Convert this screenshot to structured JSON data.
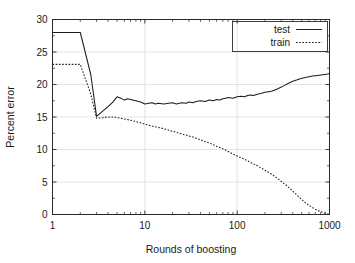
{
  "chart_data": {
    "type": "line",
    "title": "",
    "xlabel": "Rounds of boosting",
    "ylabel": "Percent error",
    "xscale": "log",
    "yscale": "linear",
    "xlim": [
      1,
      1000
    ],
    "ylim": [
      0,
      30
    ],
    "xticks": [
      1,
      10,
      100,
      1000
    ],
    "xtick_labels": [
      "1",
      "10",
      "100",
      "1000"
    ],
    "yticks": [
      0,
      5,
      10,
      15,
      20,
      25,
      30
    ],
    "ytick_labels": [
      "0",
      "5",
      "10",
      "15",
      "20",
      "25",
      "30"
    ],
    "grid": true,
    "grid_axis": "y",
    "legend_position": "top-right",
    "legend_entries": [
      {
        "name": "test",
        "style": "solid"
      },
      {
        "name": "train",
        "style": "dashed"
      }
    ],
    "series": [
      {
        "name": "test",
        "style": "solid",
        "x": [
          1,
          2,
          2.6,
          3,
          3.5,
          4,
          4.5,
          5,
          5.5,
          6,
          6.5,
          7,
          8,
          9,
          10,
          11,
          12,
          13,
          14,
          16,
          18,
          20,
          22,
          25,
          28,
          30,
          33,
          36,
          40,
          45,
          50,
          55,
          60,
          65,
          70,
          75,
          80,
          90,
          100,
          110,
          120,
          130,
          140,
          150,
          165,
          180,
          200,
          220,
          240,
          260,
          280,
          300,
          330,
          360,
          400,
          440,
          480,
          520,
          560,
          600,
          650,
          700,
          750,
          800,
          850,
          900,
          950,
          1000
        ],
        "y": [
          28.0,
          28.0,
          21.5,
          15.1,
          15.9,
          16.6,
          17.3,
          18.1,
          17.9,
          17.6,
          17.8,
          17.7,
          17.5,
          17.3,
          17.0,
          17.1,
          17.2,
          17.0,
          17.1,
          17.0,
          17.1,
          17.2,
          17.0,
          17.2,
          17.1,
          17.3,
          17.2,
          17.4,
          17.5,
          17.4,
          17.6,
          17.5,
          17.7,
          17.6,
          17.8,
          17.9,
          18.0,
          17.9,
          18.1,
          18.2,
          18.1,
          18.3,
          18.4,
          18.3,
          18.5,
          18.6,
          18.8,
          18.9,
          19.0,
          19.2,
          19.4,
          19.6,
          19.9,
          20.2,
          20.5,
          20.7,
          20.9,
          21.0,
          21.1,
          21.2,
          21.3,
          21.35,
          21.4,
          21.45,
          21.5,
          21.55,
          21.6,
          21.7
        ],
        "endpoint_value": 21.7,
        "start_value": 28.0,
        "min_value": 15.1
      },
      {
        "name": "train",
        "style": "dashed",
        "x": [
          1,
          2,
          2.6,
          3,
          3.5,
          4,
          4.5,
          5,
          5.5,
          6,
          7,
          8,
          9,
          10,
          12,
          14,
          16,
          18,
          20,
          25,
          30,
          35,
          40,
          45,
          50,
          60,
          70,
          80,
          90,
          100,
          120,
          140,
          160,
          180,
          200,
          230,
          260,
          300,
          340,
          380,
          420,
          460,
          500,
          550,
          600,
          650,
          700,
          750,
          800,
          850,
          900,
          950,
          1000
        ],
        "y": [
          23.1,
          23.1,
          18.5,
          14.8,
          14.9,
          15.0,
          15.0,
          14.9,
          14.8,
          14.7,
          14.5,
          14.3,
          14.1,
          13.9,
          13.6,
          13.4,
          13.2,
          13.0,
          12.8,
          12.4,
          12.1,
          11.8,
          11.5,
          11.2,
          11.0,
          10.5,
          10.1,
          9.7,
          9.3,
          9.0,
          8.5,
          8.0,
          7.6,
          7.2,
          6.8,
          6.3,
          5.8,
          5.1,
          4.5,
          3.9,
          3.3,
          2.8,
          2.3,
          1.8,
          1.4,
          1.1,
          0.8,
          0.6,
          0.45,
          0.3,
          0.2,
          0.1,
          0.05
        ],
        "endpoint_value": 0.05,
        "start_value": 23.1,
        "max_value": 23.1
      }
    ]
  }
}
